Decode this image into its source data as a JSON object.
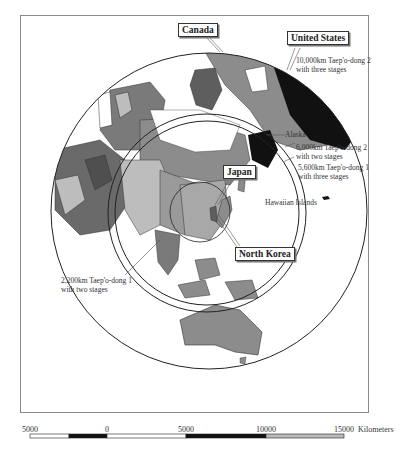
{
  "map": {
    "country_labels": {
      "canada": "Canada",
      "united_states": "United States",
      "japan": "Japan",
      "north_korea": "North Korea"
    },
    "range_labels": {
      "r10000_line1": "10,000km Taep'o-dong 2",
      "r10000_line2": "with three stages",
      "r6000_line1": "6,000km Taep'o-dong 2",
      "r6000_line2": "with two stages",
      "r5600_line1": "5,600km Taep'o-dong 1",
      "r5600_line2": "with three stages",
      "r2200_line1": "2,200km Taep'o-dong 1",
      "r2200_line2": "with two stages"
    },
    "place_labels": {
      "alaska": "Alaska",
      "hawaii": "Hawaiian Islands"
    },
    "colors": {
      "land_gray": "#8c8c8c",
      "land_dark": "#5e5e5e",
      "land_light": "#bdbdbd",
      "united_states": "#111111",
      "ocean": "#ffffff",
      "ring": "#222222"
    }
  },
  "scale_bar": {
    "ticks": [
      "5000",
      "0",
      "5000",
      "10000",
      "15000"
    ],
    "unit": "Kilometers"
  }
}
